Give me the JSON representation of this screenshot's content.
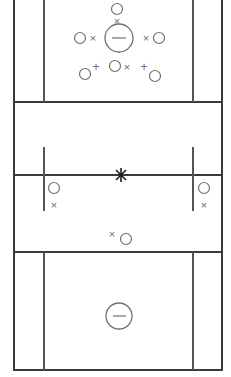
{
  "diagram": {
    "type": "sports-court-formation",
    "canvas": {
      "width": 231,
      "height": 377
    },
    "palette": {
      "background": "#ffffff",
      "court_line": "#3a3a3a",
      "court_line_thin": "#555555",
      "marker": "#707070",
      "center_mark": "#1a1a1a"
    },
    "court_lines": {
      "horizontal": [
        {
          "name": "upper-zone-line",
          "y": 102,
          "x1": 14,
          "x2": 222,
          "weight": "bold"
        },
        {
          "name": "mid-center-line",
          "y": 175,
          "x1": 14,
          "x2": 222,
          "weight": "bold"
        },
        {
          "name": "lower-zone-line",
          "y": 252,
          "x1": 14,
          "x2": 222,
          "weight": "bold"
        },
        {
          "name": "bottom-baseline",
          "y": 370,
          "x1": 14,
          "x2": 222,
          "weight": "bold"
        }
      ],
      "vertical": [
        {
          "name": "left-sideline",
          "x": 14,
          "y1": 0,
          "y2": 370,
          "weight": "bold"
        },
        {
          "name": "right-sideline",
          "x": 222,
          "y1": 0,
          "y2": 370,
          "weight": "bold"
        },
        {
          "name": "left-lane-upper",
          "x": 44,
          "y1": 0,
          "y2": 102,
          "weight": "thin"
        },
        {
          "name": "right-lane-upper",
          "x": 193,
          "y1": 0,
          "y2": 102,
          "weight": "thin"
        },
        {
          "name": "left-lane-mid",
          "x": 44,
          "y1": 147,
          "y2": 211,
          "weight": "thin"
        },
        {
          "name": "right-lane-mid",
          "x": 193,
          "y1": 147,
          "y2": 211,
          "weight": "thin"
        },
        {
          "name": "left-lane-lower",
          "x": 44,
          "y1": 252,
          "y2": 370,
          "weight": "thin"
        },
        {
          "name": "right-lane-lower",
          "x": 193,
          "y1": 252,
          "y2": 370,
          "weight": "thin"
        }
      ]
    },
    "markers": [
      {
        "name": "top-circle",
        "glyph": "circle",
        "cx": 117,
        "cy": 9,
        "r": 5.5
      },
      {
        "name": "top-x",
        "glyph": "x",
        "cx": 117,
        "cy": 21
      },
      {
        "name": "center-circle-minus",
        "glyph": "circle-minus",
        "cx": 119,
        "cy": 38,
        "r": 14
      },
      {
        "name": "left-circle",
        "glyph": "circle",
        "cx": 80,
        "cy": 38,
        "r": 5.5
      },
      {
        "name": "left-x",
        "glyph": "x",
        "cx": 93,
        "cy": 38
      },
      {
        "name": "right-x",
        "glyph": "x",
        "cx": 146,
        "cy": 38
      },
      {
        "name": "right-circle",
        "glyph": "circle",
        "cx": 159,
        "cy": 38,
        "r": 5.5
      },
      {
        "name": "lower-left-circle",
        "glyph": "circle",
        "cx": 85,
        "cy": 74,
        "r": 5.5
      },
      {
        "name": "lower-left-plus",
        "glyph": "plus",
        "cx": 96,
        "cy": 67
      },
      {
        "name": "lower-mid-circle",
        "glyph": "circle",
        "cx": 115,
        "cy": 66,
        "r": 5.5
      },
      {
        "name": "lower-mid-x",
        "glyph": "x",
        "cx": 127,
        "cy": 67
      },
      {
        "name": "lower-right-plus",
        "glyph": "plus",
        "cx": 144,
        "cy": 67
      },
      {
        "name": "lower-right-circle",
        "glyph": "circle",
        "cx": 155,
        "cy": 76,
        "r": 5.5
      },
      {
        "name": "center-star-mark",
        "glyph": "star",
        "cx": 121,
        "cy": 175
      },
      {
        "name": "mid-left-circle",
        "glyph": "circle",
        "cx": 54,
        "cy": 188,
        "r": 5.5
      },
      {
        "name": "mid-left-x",
        "glyph": "x",
        "cx": 54,
        "cy": 205
      },
      {
        "name": "mid-right-circle",
        "glyph": "circle",
        "cx": 204,
        "cy": 188,
        "r": 5.5
      },
      {
        "name": "mid-right-x",
        "glyph": "x",
        "cx": 204,
        "cy": 205
      },
      {
        "name": "low-mid-x",
        "glyph": "x",
        "cx": 112,
        "cy": 234
      },
      {
        "name": "low-mid-circle",
        "glyph": "circle",
        "cx": 126,
        "cy": 239,
        "r": 5.5
      },
      {
        "name": "bottom-circle-minus",
        "glyph": "circle-minus",
        "cx": 119,
        "cy": 316,
        "r": 13
      }
    ],
    "glyph_text": {
      "x": "×",
      "plus": "+"
    }
  }
}
